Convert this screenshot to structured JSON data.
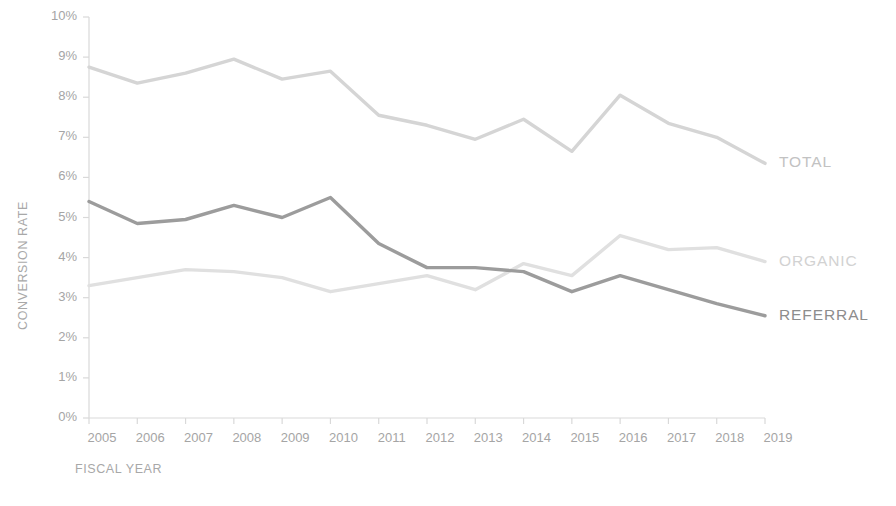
{
  "chart_data": {
    "type": "line",
    "title": "",
    "xlabel": "FISCAL YEAR",
    "ylabel": "CONVERSION RATE",
    "categories": [
      "2005",
      "2006",
      "2007",
      "2008",
      "2009",
      "2010",
      "2011",
      "2012",
      "2013",
      "2014",
      "2015",
      "2016",
      "2017",
      "2018",
      "2019"
    ],
    "x": [
      2005,
      2006,
      2007,
      2008,
      2009,
      2010,
      2011,
      2012,
      2013,
      2014,
      2015,
      2016,
      2017,
      2018,
      2019
    ],
    "ylim": [
      0,
      10
    ],
    "ytick_labels": [
      "0%",
      "1%",
      "2%",
      "3%",
      "4%",
      "5%",
      "6%",
      "7%",
      "8%",
      "9%",
      "10%"
    ],
    "ytick_values": [
      0,
      1,
      2,
      3,
      4,
      5,
      6,
      7,
      8,
      9,
      10
    ],
    "grid": false,
    "legend_position": "right-inline-labels",
    "series": [
      {
        "name": "TOTAL",
        "color": "#d5d5d5",
        "label_color": "#c2c2c2",
        "values": [
          8.75,
          8.35,
          8.6,
          8.95,
          8.45,
          8.65,
          7.55,
          7.3,
          6.95,
          7.45,
          6.65,
          8.05,
          7.35,
          7.0,
          6.35
        ]
      },
      {
        "name": "ORGANIC",
        "color": "#e0e0e0",
        "label_color": "#d2d2d2",
        "values": [
          3.3,
          3.5,
          3.7,
          3.65,
          3.5,
          3.15,
          3.35,
          3.55,
          3.2,
          3.85,
          3.55,
          4.55,
          4.2,
          4.25,
          3.9
        ]
      },
      {
        "name": "REFERRAL",
        "color": "#9c9c9c",
        "label_color": "#8d8d8d",
        "values": [
          5.4,
          4.85,
          4.95,
          5.3,
          5.0,
          5.5,
          4.35,
          3.75,
          3.75,
          3.65,
          3.15,
          3.55,
          3.2,
          2.85,
          2.55
        ]
      }
    ]
  },
  "axis": {
    "y_title": "CONVERSION RATE",
    "x_title": "FISCAL YEAR",
    "axis_color": "#d9d9d9",
    "tick_color": "#a5a5a5"
  },
  "series_labels": [
    {
      "name": "TOTAL",
      "text": "TOTAL"
    },
    {
      "name": "ORGANIC",
      "text": "ORGANIC"
    },
    {
      "name": "REFERRAL",
      "text": "REFERRAL"
    }
  ]
}
